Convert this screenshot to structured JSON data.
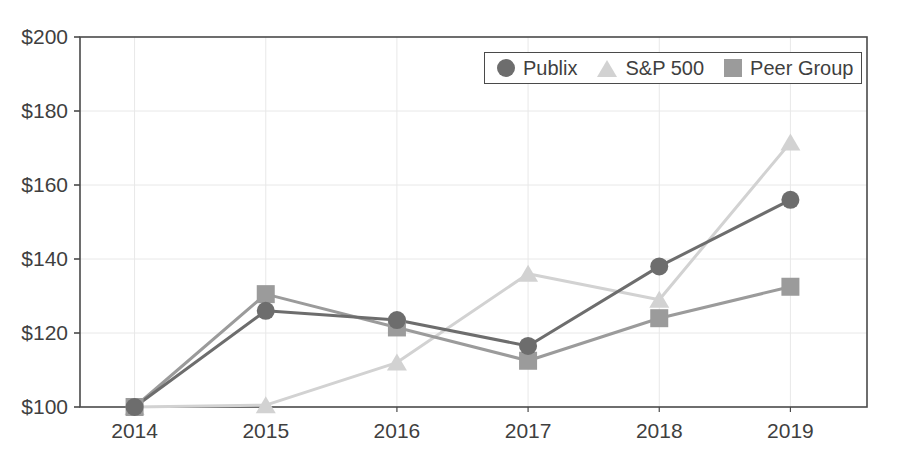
{
  "chart_data": {
    "type": "line",
    "title": "",
    "subtitle": "",
    "xlabel": "",
    "ylabel": "",
    "categories": [
      "2014",
      "2015",
      "2016",
      "2017",
      "2018",
      "2019"
    ],
    "x_tick_labels": [
      "2014",
      "2015",
      "2016",
      "2017",
      "2018",
      "2019"
    ],
    "y_tick_labels": [
      "$100",
      "$120",
      "$140",
      "$160",
      "$180",
      "$200"
    ],
    "y_tick_values": [
      100,
      120,
      140,
      160,
      180,
      200
    ],
    "ylim": [
      100,
      200
    ],
    "grid": true,
    "grid_axes": "both",
    "legend_position": "top-right",
    "value_prefix": "$",
    "series": [
      {
        "name": "Publix",
        "marker": "circle",
        "color": "#6d6d6d",
        "line_color": "#6d6d6d",
        "values": [
          100,
          126,
          123.5,
          116.5,
          138,
          156
        ]
      },
      {
        "name": "S&P 500",
        "marker": "triangle",
        "color": "#d2d2d2",
        "line_color": "#d2d2d2",
        "values": [
          100,
          100.5,
          112,
          136,
          129,
          171.5
        ]
      },
      {
        "name": "Peer Group",
        "marker": "square",
        "color": "#9b9b9b",
        "line_color": "#9b9b9b",
        "values": [
          100,
          130.5,
          121.5,
          112.5,
          124,
          132.5
        ]
      }
    ]
  },
  "legend": {
    "items": [
      {
        "label": "Publix",
        "marker": "circle",
        "color": "#6d6d6d"
      },
      {
        "label": "S&P 500",
        "marker": "triangle",
        "color": "#d2d2d2"
      },
      {
        "label": "Peer Group",
        "marker": "square",
        "color": "#9b9b9b"
      }
    ]
  },
  "axes": {
    "frame_color": "#4a4a4a",
    "grid_color": "#e8e8e8"
  }
}
